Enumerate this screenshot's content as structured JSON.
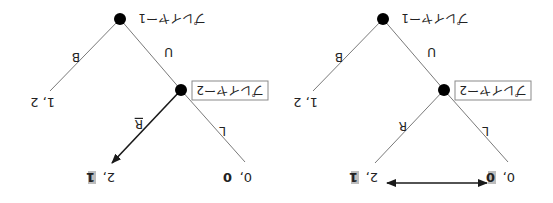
{
  "trees": [
    {
      "id": "left",
      "player1_label": "プレイヤー1",
      "player2_label": "プレイヤー2",
      "action_p1_left": "B",
      "action_p1_right": "U",
      "action_p2_left": "R",
      "action_p2_right": "L",
      "payoff_b": "1, 2",
      "payoff_r_a": "2, ",
      "payoff_r_b": "1",
      "payoff_l_a": "0, ",
      "payoff_l_b": "0",
      "note": "R branch drawn as bold arrow; player-2 payoff 1 highlighted"
    },
    {
      "id": "right",
      "player1_label": "プレイヤー1",
      "player2_label": "プレイヤー2",
      "action_p1_left": "B",
      "action_p1_right": "U",
      "action_p2_left": "R",
      "action_p2_right": "L",
      "payoff_b": "1, 2",
      "payoff_r_a": "2, ",
      "payoff_r_b": "1",
      "payoff_l_a": "0, ",
      "payoff_l_b": "0",
      "note": "double-headed arrow comparing player-2 payoffs 1 vs 0"
    }
  ],
  "colors": {
    "edge": "#7a7a7a",
    "arrow": "#1a1a1a",
    "node": "#000000",
    "highlight": "#bdbdbd"
  },
  "orientation": "rotated 180 degrees"
}
